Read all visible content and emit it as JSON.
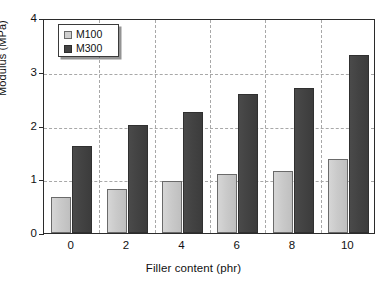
{
  "chart_data": {
    "type": "bar",
    "title": "",
    "subtitle": "",
    "xlabel": "Filler content (phr)",
    "ylabel": "Modulus (MPa)",
    "categories": [
      "0",
      "2",
      "4",
      "6",
      "8",
      "10"
    ],
    "series": [
      {
        "name": "M100",
        "color": "#cfcfcf",
        "values": [
          0.67,
          0.81,
          0.97,
          1.09,
          1.15,
          1.38
        ]
      },
      {
        "name": "M300",
        "color": "#434343",
        "values": [
          1.62,
          2.01,
          2.26,
          2.58,
          2.69,
          3.31
        ]
      }
    ],
    "ylim": [
      0,
      4
    ],
    "yticks": [
      "0",
      "1",
      "2",
      "3",
      "4"
    ],
    "ytick_values": [
      0,
      1,
      2,
      3,
      4
    ],
    "xlim": [
      0,
      6
    ],
    "grid": "horizontal-and-vertical-dashed",
    "legend_position": "top-left-inside",
    "legend_entries": [
      "M100",
      "M300"
    ],
    "annotations": []
  },
  "axes": {
    "y_title": "Modulus (MPa)",
    "x_title": "Filler content (phr)"
  }
}
